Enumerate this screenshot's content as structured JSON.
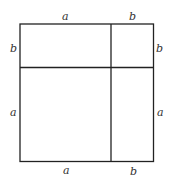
{
  "diagram": {
    "title": "",
    "colors": {
      "line": "#222222",
      "label": "#333333",
      "background": "#ffffff"
    },
    "labels": {
      "top_a": "a",
      "top_b": "b",
      "left_b": "b",
      "right_b": "b",
      "left_a": "a",
      "right_a": "a",
      "bottom_a": "a",
      "bottom_b": "b"
    },
    "regions": [
      {
        "name": "top-left",
        "width": "a",
        "height": "b"
      },
      {
        "name": "top-right",
        "width": "b",
        "height": "b"
      },
      {
        "name": "bottom-left",
        "width": "a",
        "height": "a"
      },
      {
        "name": "bottom-right",
        "width": "b",
        "height": "a"
      }
    ]
  }
}
